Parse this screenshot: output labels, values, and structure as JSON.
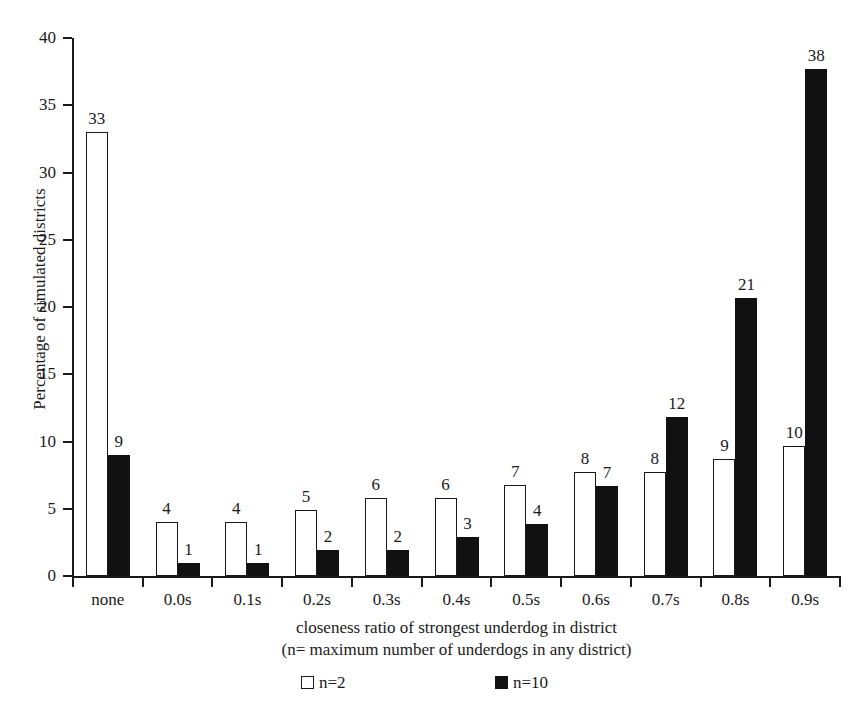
{
  "chart_data": {
    "type": "bar",
    "title": "",
    "subtitle": "",
    "xlabel": "closeness ratio of strongest underdog in district",
    "xlabel_line2": "(n= maximum number of underdogs in any district)",
    "ylabel": "Percentage of simulated districts",
    "ylim": [
      0,
      40
    ],
    "yticks": [
      0,
      5,
      10,
      15,
      20,
      25,
      30,
      35,
      40
    ],
    "ytick_labels": [
      "0",
      "5",
      "10",
      "15",
      "20",
      "25",
      "30",
      "35",
      "40"
    ],
    "grid": false,
    "legend_position": "bottom",
    "categories": [
      "none",
      "0.0s",
      "0.1s",
      "0.2s",
      "0.3s",
      "0.4s",
      "0.5s",
      "0.6s",
      "0.7s",
      "0.8s",
      "0.9s"
    ],
    "series": [
      {
        "name": "n=2",
        "color": "#ffffff",
        "edge_color": "#1a1a1a",
        "values": [
          33.0,
          4.0,
          4.0,
          4.9,
          5.8,
          5.8,
          6.8,
          7.7,
          7.7,
          8.7,
          9.7
        ],
        "labels": [
          "33",
          "4",
          "4",
          "5",
          "6",
          "6",
          "7",
          "8",
          "8",
          "9",
          "10"
        ]
      },
      {
        "name": "n=10",
        "color": "#111111",
        "edge_color": "#111111",
        "values": [
          9.0,
          1.0,
          1.0,
          1.9,
          1.9,
          2.9,
          3.9,
          6.7,
          11.8,
          20.7,
          37.7
        ],
        "labels": [
          "9",
          "1",
          "1",
          "2",
          "2",
          "3",
          "4",
          "7",
          "12",
          "21",
          "38"
        ]
      }
    ]
  },
  "legend": {
    "items": [
      {
        "label": "n=2",
        "swatch": "light-square-icon"
      },
      {
        "label": "n=10",
        "swatch": "dark-square-icon"
      }
    ]
  }
}
